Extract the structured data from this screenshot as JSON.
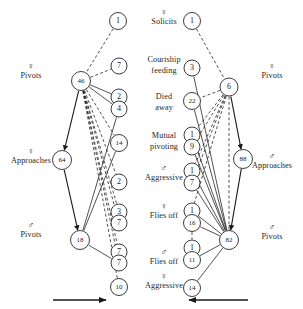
{
  "figure": {
    "width": 303,
    "height": 309,
    "background": "#ffffff",
    "ink_color": "#1a1a1a"
  },
  "center_stages": [
    {
      "symbol": "♀",
      "text": "Solicits",
      "x": 164,
      "y": 8
    },
    {
      "symbol": "",
      "text": "Courtship\nfeeding",
      "x": 164,
      "y": 55
    },
    {
      "symbol": "",
      "text": "Died\naway",
      "x": 164,
      "y": 92
    },
    {
      "symbol": "",
      "text": "Mutual\npivoting",
      "x": 164,
      "y": 131
    },
    {
      "symbol": "♂",
      "text": "Aggressive",
      "x": 164,
      "y": 164
    },
    {
      "symbol": "♀",
      "text": "Flies off",
      "x": 164,
      "y": 202
    },
    {
      "symbol": "♂",
      "text": "Flies off",
      "x": 164,
      "y": 248
    },
    {
      "symbol": "♀",
      "text": "Aggressive",
      "x": 164,
      "y": 272
    }
  ],
  "left_labels": [
    {
      "symbol": "♀",
      "text": "Pivots",
      "x": 31,
      "y": 62
    },
    {
      "symbol": "♀",
      "text": "Approaches",
      "x": 31,
      "y": 147
    },
    {
      "symbol": "♂",
      "text": "Pivots",
      "x": 31,
      "y": 221
    }
  ],
  "right_labels": [
    {
      "symbol": "♀",
      "text": "Pivots",
      "x": 272,
      "y": 62
    },
    {
      "symbol": "♂",
      "text": "Approaches",
      "x": 272,
      "y": 152
    },
    {
      "symbol": "♂",
      "text": "Pivots",
      "x": 272,
      "y": 223
    }
  ],
  "chart_data": {
    "type": "diagram",
    "title": "",
    "nodes": [
      {
        "id": "L-top-1",
        "label": "1",
        "x": 118,
        "y": 21,
        "r": 8.5,
        "side": "left"
      },
      {
        "id": "L-46",
        "label": "46",
        "x": 81,
        "y": 81,
        "r": 9.5,
        "side": "left"
      },
      {
        "id": "L-7a",
        "label": "7",
        "x": 119,
        "y": 66,
        "r": 8,
        "side": "left"
      },
      {
        "id": "L-2a",
        "label": "2",
        "x": 119,
        "y": 97,
        "r": 8,
        "side": "left"
      },
      {
        "id": "L-4",
        "label": "4",
        "x": 119,
        "y": 109,
        "r": 8,
        "side": "left"
      },
      {
        "id": "L-14",
        "label": "14",
        "x": 119,
        "y": 143,
        "r": 8.5,
        "side": "left"
      },
      {
        "id": "L-64",
        "label": "64",
        "x": 62,
        "y": 160,
        "r": 9.5,
        "side": "left"
      },
      {
        "id": "L-2b",
        "label": "2",
        "x": 119,
        "y": 182,
        "r": 8,
        "side": "left"
      },
      {
        "id": "L-3",
        "label": "3",
        "x": 119,
        "y": 212,
        "r": 8,
        "side": "left"
      },
      {
        "id": "L-7b",
        "label": "7",
        "x": 119,
        "y": 223,
        "r": 8,
        "side": "left"
      },
      {
        "id": "L-18",
        "label": "18",
        "x": 80,
        "y": 240,
        "r": 9.5,
        "side": "left"
      },
      {
        "id": "L-7c",
        "label": "7",
        "x": 119,
        "y": 252,
        "r": 8,
        "side": "left"
      },
      {
        "id": "L-7d",
        "label": "7",
        "x": 119,
        "y": 263,
        "r": 8,
        "side": "left"
      },
      {
        "id": "L-10",
        "label": "10",
        "x": 119,
        "y": 287,
        "r": 8.5,
        "side": "left"
      },
      {
        "id": "R-top-1",
        "label": "1",
        "x": 192,
        "y": 21,
        "r": 8.5,
        "side": "right"
      },
      {
        "id": "R-3",
        "label": "3",
        "x": 192,
        "y": 68,
        "r": 8,
        "side": "right"
      },
      {
        "id": "R-6",
        "label": "6",
        "x": 229,
        "y": 87,
        "r": 9,
        "side": "right"
      },
      {
        "id": "R-22",
        "label": "22",
        "x": 192,
        "y": 101,
        "r": 8.5,
        "side": "right"
      },
      {
        "id": "R-1a",
        "label": "1",
        "x": 192,
        "y": 135,
        "r": 8,
        "side": "right"
      },
      {
        "id": "R-9",
        "label": "9",
        "x": 192,
        "y": 147,
        "r": 8,
        "side": "right"
      },
      {
        "id": "R-1b",
        "label": "1",
        "x": 192,
        "y": 171,
        "r": 8,
        "side": "right"
      },
      {
        "id": "R-7",
        "label": "7",
        "x": 192,
        "y": 183,
        "r": 8,
        "side": "right"
      },
      {
        "id": "R-88",
        "label": "88",
        "x": 243,
        "y": 159,
        "r": 9.5,
        "side": "right"
      },
      {
        "id": "R-1c",
        "label": "1",
        "x": 192,
        "y": 211,
        "r": 8,
        "side": "right"
      },
      {
        "id": "R-16",
        "label": "16",
        "x": 192,
        "y": 223,
        "r": 8.5,
        "side": "right"
      },
      {
        "id": "R-82",
        "label": "82",
        "x": 229,
        "y": 240,
        "r": 9.5,
        "side": "right"
      },
      {
        "id": "R-1d",
        "label": "1",
        "x": 192,
        "y": 248,
        "r": 8,
        "side": "right"
      },
      {
        "id": "R-11",
        "label": "11",
        "x": 192,
        "y": 260,
        "r": 8.5,
        "side": "right"
      },
      {
        "id": "R-14",
        "label": "14",
        "x": 192,
        "y": 288,
        "r": 8.5,
        "side": "right"
      }
    ],
    "edges": [
      {
        "from": "L-top-1",
        "to": "L-46",
        "style": "dashed",
        "arrow": false
      },
      {
        "from": "L-46",
        "to": "L-7a",
        "style": "dashed",
        "arrow": false
      },
      {
        "from": "L-46",
        "to": "L-2a",
        "style": "solid",
        "arrow": false
      },
      {
        "from": "L-46",
        "to": "L-4",
        "style": "solid",
        "arrow": false
      },
      {
        "from": "L-46",
        "to": "L-14",
        "style": "dashed",
        "arrow": false
      },
      {
        "from": "L-46",
        "to": "L-2b",
        "style": "dashed",
        "arrow": false
      },
      {
        "from": "L-46",
        "to": "L-3",
        "style": "dashed",
        "arrow": false
      },
      {
        "from": "L-46",
        "to": "L-7b",
        "style": "dashed",
        "arrow": false
      },
      {
        "from": "L-46",
        "to": "L-7c",
        "style": "dashed",
        "arrow": false
      },
      {
        "from": "L-46",
        "to": "L-7d",
        "style": "dashed",
        "arrow": false
      },
      {
        "from": "L-46",
        "to": "L-10",
        "style": "dashed",
        "arrow": false
      },
      {
        "from": "L-46",
        "to": "L-64",
        "style": "solid",
        "arrow": true
      },
      {
        "from": "L-64",
        "to": "L-18",
        "style": "solid",
        "arrow": true
      },
      {
        "from": "L-4",
        "to": "L-18",
        "style": "solid",
        "arrow": false
      },
      {
        "from": "L-14",
        "to": "L-18",
        "style": "solid",
        "arrow": false
      },
      {
        "from": "L-18",
        "to": "L-7d",
        "style": "solid",
        "arrow": false
      },
      {
        "from": "R-top-1",
        "to": "R-6",
        "style": "dashed",
        "arrow": false
      },
      {
        "from": "R-6",
        "to": "R-22",
        "style": "dashed",
        "arrow": false
      },
      {
        "from": "R-6",
        "to": "R-1a",
        "style": "dashed",
        "arrow": false
      },
      {
        "from": "R-6",
        "to": "R-9",
        "style": "dashed",
        "arrow": false
      },
      {
        "from": "R-6",
        "to": "R-1b",
        "style": "dashed",
        "arrow": false
      },
      {
        "from": "R-6",
        "to": "R-7",
        "style": "dashed",
        "arrow": false
      },
      {
        "from": "R-6",
        "to": "R-1c",
        "style": "dashed",
        "arrow": false
      },
      {
        "from": "R-6",
        "to": "R-82",
        "style": "dashed",
        "arrow": false
      },
      {
        "from": "R-6",
        "to": "R-88",
        "style": "solid",
        "arrow": true
      },
      {
        "from": "R-88",
        "to": "R-82",
        "style": "solid",
        "arrow": true
      },
      {
        "from": "R-3",
        "to": "R-82",
        "style": "solid",
        "arrow": false
      },
      {
        "from": "R-22",
        "to": "R-82",
        "style": "solid",
        "arrow": false
      },
      {
        "from": "R-1a",
        "to": "R-82",
        "style": "solid",
        "arrow": false
      },
      {
        "from": "R-9",
        "to": "R-82",
        "style": "solid",
        "arrow": false
      },
      {
        "from": "R-1b",
        "to": "R-82",
        "style": "solid",
        "arrow": false
      },
      {
        "from": "R-7",
        "to": "R-82",
        "style": "solid",
        "arrow": false
      },
      {
        "from": "R-1c",
        "to": "R-82",
        "style": "solid",
        "arrow": false
      },
      {
        "from": "R-16",
        "to": "R-82",
        "style": "solid",
        "arrow": false
      },
      {
        "from": "R-16",
        "to": "R-1d",
        "style": "dashed",
        "arrow": false
      },
      {
        "from": "R-11",
        "to": "R-82",
        "style": "solid",
        "arrow": false
      },
      {
        "from": "R-14",
        "to": "R-82",
        "style": "solid",
        "arrow": false
      }
    ],
    "time_arrows": [
      {
        "name": "left-time-arrow",
        "x1": 53,
        "y1": 300,
        "x2": 106,
        "y2": 300,
        "direction": "right"
      },
      {
        "name": "right-time-arrow",
        "x1": 248,
        "y1": 300,
        "x2": 189,
        "y2": 300,
        "direction": "left"
      }
    ]
  }
}
